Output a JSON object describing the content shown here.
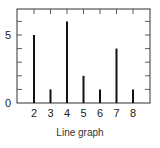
{
  "chart_data": {
    "type": "bar",
    "title": "",
    "caption": "Line graph",
    "xlabel": "",
    "ylabel": "",
    "categories": [
      2,
      3,
      4,
      5,
      6,
      7,
      8
    ],
    "values": [
      5,
      1,
      6,
      2,
      1,
      4,
      1
    ],
    "xlim": [
      1,
      9
    ],
    "ylim": [
      0,
      7
    ],
    "y_tick_labels": [
      0,
      5
    ],
    "x_tick_labels": [
      2,
      3,
      4,
      5,
      6,
      7,
      8
    ],
    "grid": false,
    "legend": null,
    "bar_style": "thin vertical lines",
    "colors": {
      "line": "#111111",
      "frame": "#333333",
      "text": "#222222"
    }
  },
  "caption": "Line graph"
}
